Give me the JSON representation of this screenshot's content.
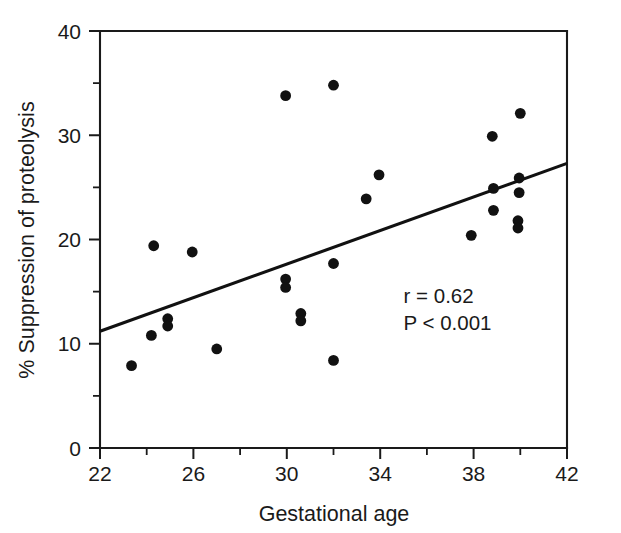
{
  "chart_data": {
    "type": "scatter",
    "title": "",
    "xlabel": "Gestational age",
    "ylabel": "% Suppression of proteolysis",
    "xlim": [
      22,
      42
    ],
    "ylim": [
      0,
      40
    ],
    "grid": false,
    "legend": null,
    "x_ticks_major": [
      22,
      26,
      30,
      34,
      38,
      42
    ],
    "x_ticks_minor": [
      24,
      28,
      32,
      36,
      40
    ],
    "y_ticks_major": [
      0,
      10,
      20,
      30,
      40
    ],
    "y_ticks_minor": [
      5,
      15,
      25,
      35
    ],
    "x_tick_labels": [
      "22",
      "26",
      "30",
      "34",
      "38",
      "42"
    ],
    "y_tick_labels": [
      "0",
      "10",
      "20",
      "30",
      "40"
    ],
    "marker": "filled-circle",
    "marker_color": "#111111",
    "points": [
      {
        "x": 23.35,
        "y": 7.9
      },
      {
        "x": 24.3,
        "y": 19.4
      },
      {
        "x": 24.2,
        "y": 10.8
      },
      {
        "x": 24.9,
        "y": 12.4
      },
      {
        "x": 24.9,
        "y": 11.7
      },
      {
        "x": 25.95,
        "y": 18.8
      },
      {
        "x": 27.0,
        "y": 9.5
      },
      {
        "x": 29.95,
        "y": 33.8
      },
      {
        "x": 29.95,
        "y": 16.2
      },
      {
        "x": 29.95,
        "y": 15.4
      },
      {
        "x": 30.6,
        "y": 12.9
      },
      {
        "x": 30.6,
        "y": 12.2
      },
      {
        "x": 32.0,
        "y": 34.8
      },
      {
        "x": 32.0,
        "y": 17.7
      },
      {
        "x": 32.0,
        "y": 8.4
      },
      {
        "x": 33.4,
        "y": 23.9
      },
      {
        "x": 33.95,
        "y": 26.2
      },
      {
        "x": 37.9,
        "y": 20.4
      },
      {
        "x": 38.8,
        "y": 29.9
      },
      {
        "x": 38.85,
        "y": 24.9
      },
      {
        "x": 38.85,
        "y": 22.8
      },
      {
        "x": 40.0,
        "y": 32.1
      },
      {
        "x": 39.95,
        "y": 25.9
      },
      {
        "x": 39.95,
        "y": 24.5
      },
      {
        "x": 39.9,
        "y": 21.8
      },
      {
        "x": 39.9,
        "y": 21.1
      }
    ],
    "regression_line": {
      "x_start": 22,
      "y_start": 11.2,
      "x_end": 42,
      "y_end": 27.3,
      "color": "#111111"
    },
    "annotations": [
      {
        "text": "r = 0.62",
        "x": 35.0,
        "y": 13.9
      },
      {
        "text": "P < 0.001",
        "x": 35.0,
        "y": 11.3
      }
    ]
  }
}
